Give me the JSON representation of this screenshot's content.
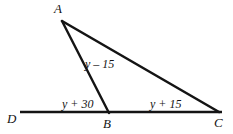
{
  "figure": {
    "type": "geometry-diagram",
    "background_color": "#ffffff",
    "stroke_color": "#141414",
    "points": {
      "A": {
        "label": "A",
        "x": 62,
        "y": 21
      },
      "B": {
        "label": "B",
        "x": 108,
        "y": 112
      },
      "C": {
        "label": "C",
        "x": 217,
        "y": 112
      },
      "D": {
        "label": "D",
        "x": 20,
        "y": 112
      }
    },
    "segments": [
      {
        "name": "segment-DC",
        "from": "D",
        "to": "C",
        "width": 2.6
      },
      {
        "name": "segment-AB",
        "from": "A",
        "to": "B",
        "width": 2.4
      },
      {
        "name": "segment-AC",
        "from": "A",
        "to": "C",
        "width": 2.6
      }
    ],
    "angle_labels": [
      {
        "name": "angle-label-ABC-interior",
        "text": "y – 15",
        "at_segment": "AB",
        "x": 85,
        "y": 58
      },
      {
        "name": "angle-label-ABD",
        "text": "y + 30",
        "at_segment": "DB",
        "x": 62,
        "y": 98
      },
      {
        "name": "angle-label-BCA",
        "text": "y + 15",
        "at_segment": "BC",
        "x": 150,
        "y": 98
      }
    ]
  }
}
